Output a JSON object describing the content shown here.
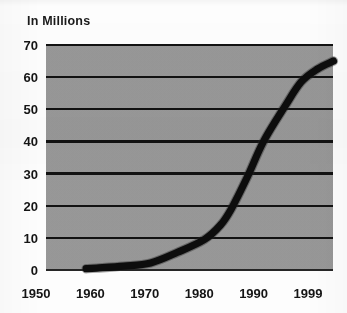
{
  "chart_data": {
    "type": "line",
    "title": "In Millions",
    "xlabel": "",
    "ylabel": "",
    "ylim": [
      0,
      70
    ],
    "xlim": [
      1950,
      1999
    ],
    "grid": true,
    "legend": false,
    "series_color": "#0d0d0d",
    "plot_background": "#989898",
    "ytick_labels": [
      "70",
      "60",
      "50",
      "40",
      "30",
      "20",
      "10",
      "0"
    ],
    "ytick_values": [
      70,
      60,
      50,
      40,
      30,
      20,
      10,
      0
    ],
    "xtick_labels": [
      "1950",
      "1960",
      "1970",
      "1980",
      "1990",
      "1999"
    ],
    "xtick_values": [
      1950,
      1960,
      1970,
      1980,
      1990,
      1999
    ],
    "x": [
      1953,
      1955,
      1960,
      1965,
      1970,
      1975,
      1978,
      1980,
      1983,
      1986,
      1990,
      1993,
      1996,
      1999
    ],
    "values": [
      0.4,
      0.6,
      1.2,
      2.2,
      5.5,
      9.5,
      14.0,
      19.0,
      29.0,
      40.0,
      51.0,
      58.5,
      62.5,
      65.0
    ],
    "series": [
      {
        "name": "In Millions",
        "values": [
          0.4,
          0.6,
          1.2,
          2.2,
          5.5,
          9.5,
          14.0,
          19.0,
          29.0,
          40.0,
          51.0,
          58.5,
          62.5,
          65.0
        ]
      }
    ]
  }
}
